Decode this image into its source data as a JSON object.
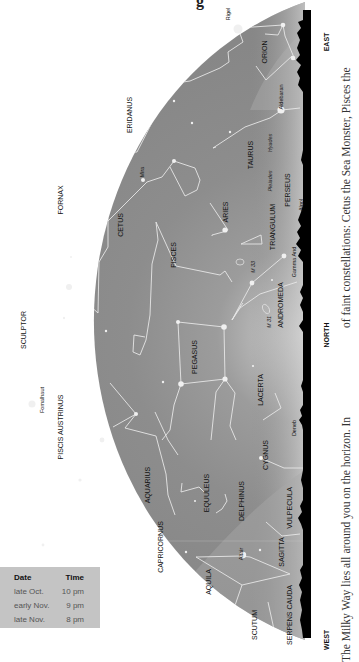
{
  "title_fragment": "g",
  "directions": {
    "east": "EAST",
    "north": "NORTH",
    "west": "WEST"
  },
  "constellations": [
    {
      "name": "ORION",
      "x": 267,
      "y": 52
    },
    {
      "name": "ERIDANUS",
      "x": 132,
      "y": 115
    },
    {
      "name": "TAURUS",
      "x": 253,
      "y": 155
    },
    {
      "name": "FORNAX",
      "x": 63,
      "y": 200
    },
    {
      "name": "CETUS",
      "x": 123,
      "y": 225
    },
    {
      "name": "ARIES",
      "x": 228,
      "y": 212
    },
    {
      "name": "PERSEUS",
      "x": 290,
      "y": 190
    },
    {
      "name": "TRIANGULUM",
      "x": 275,
      "y": 227
    },
    {
      "name": "PISCES",
      "x": 176,
      "y": 255
    },
    {
      "name": "ANDROMEDA",
      "x": 283,
      "y": 305
    },
    {
      "name": "SCULPTOR",
      "x": 26,
      "y": 330
    },
    {
      "name": "PEGASUS",
      "x": 197,
      "y": 357
    },
    {
      "name": "LACERTA",
      "x": 263,
      "y": 390
    },
    {
      "name": "PISCIS AUSTRINUS",
      "x": 63,
      "y": 427
    },
    {
      "name": "CYGNUS",
      "x": 268,
      "y": 455
    },
    {
      "name": "AQUARIUS",
      "x": 150,
      "y": 485
    },
    {
      "name": "EQUULEUS",
      "x": 209,
      "y": 493
    },
    {
      "name": "DELPHINUS",
      "x": 244,
      "y": 501
    },
    {
      "name": "VULPECULA",
      "x": 292,
      "y": 508
    },
    {
      "name": "CAPRICORNUS",
      "x": 163,
      "y": 547
    },
    {
      "name": "SAGITTA",
      "x": 284,
      "y": 552
    },
    {
      "name": "AQUILA",
      "x": 211,
      "y": 582
    },
    {
      "name": "SCUTUM",
      "x": 257,
      "y": 625
    },
    {
      "name": "SERPENS CAUDA",
      "x": 292,
      "y": 615
    }
  ],
  "stars": [
    {
      "name": "Rigel",
      "x": 230,
      "y": 14
    },
    {
      "name": "Aldebaran",
      "x": 283,
      "y": 97
    },
    {
      "name": "Mira",
      "x": 144,
      "y": 172
    },
    {
      "name": "Hyades",
      "x": 272,
      "y": 143
    },
    {
      "name": "Pleiades",
      "x": 272,
      "y": 181
    },
    {
      "name": "Algol",
      "x": 303,
      "y": 205
    },
    {
      "name": "Gamma And",
      "x": 296,
      "y": 262
    },
    {
      "name": "M 33",
      "x": 255,
      "y": 267
    },
    {
      "name": "M 31",
      "x": 271,
      "y": 322
    },
    {
      "name": "Deneb",
      "x": 296,
      "y": 428
    },
    {
      "name": "Fomalhaut",
      "x": 44,
      "y": 400
    },
    {
      "name": "Altair",
      "x": 243,
      "y": 554
    }
  ],
  "time_table": {
    "headers": [
      "Date",
      "Time"
    ],
    "rows": [
      [
        "late Oct.",
        "10 pm"
      ],
      [
        "early Nov.",
        "9 pm"
      ],
      [
        "late Nov.",
        "8 pm"
      ]
    ]
  },
  "body_text": {
    "col1": "The Milky Way lies all around you on the horizon. In",
    "col2": "of faint constellations: Cetus the Sea Monster, Pisces the"
  },
  "colors": {
    "sky": "#8e8e8e",
    "horizon_glow": "#cfcfcf",
    "ground": "#000000",
    "table_bg": "#c4c4c4"
  }
}
